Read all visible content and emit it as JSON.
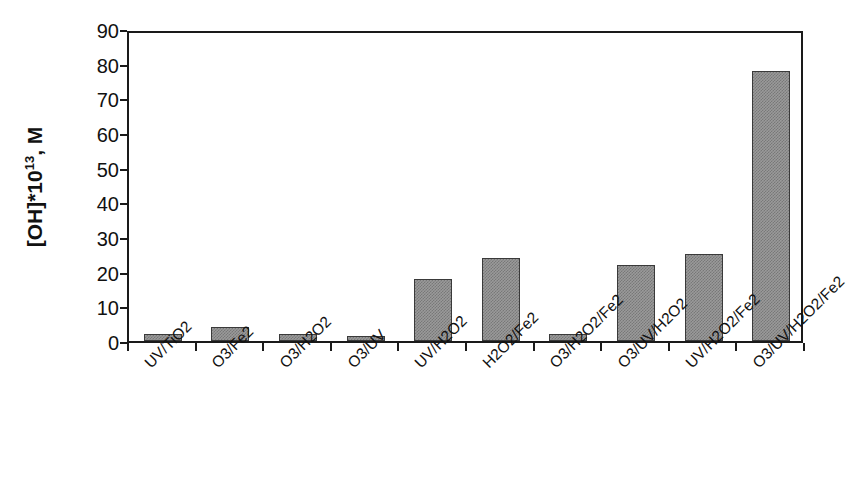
{
  "chart_data": {
    "type": "bar",
    "title": "",
    "subtitle": "",
    "xlabel": "",
    "ylabel": "[OH]*10^13, M",
    "ylabel_parts": {
      "base": "[OH]*10",
      "exponent": "13",
      "suffix": ", M"
    },
    "categories": [
      "UV/TiO2",
      "O3/Fe2",
      "O3/H2O2",
      "O3/UV",
      "UV/H2O2",
      "H2O2/Fe2",
      "O3/H2O2/Fe2",
      "O3/UV/H2O2",
      "UV/H2O2/Fe2",
      "O3/UV/H2O2/Fe2"
    ],
    "values": [
      2,
      4,
      2,
      1.5,
      18,
      24,
      2,
      22,
      25,
      78
    ],
    "ylim": [
      0,
      90
    ],
    "ytick_values": [
      0,
      10,
      20,
      30,
      40,
      50,
      60,
      70,
      80,
      90
    ],
    "ytick_labels": [
      "0",
      "10",
      "20",
      "30",
      "40",
      "50",
      "60",
      "70",
      "80",
      "90"
    ],
    "grid": false,
    "legend": null,
    "legend_position": "none",
    "bar_fill_color": "#9a9a9a",
    "bar_pattern_color": "#787878",
    "bar_edge_color": "#3a3a3a",
    "axis_color": "#1a1a1a",
    "background_color": "#ffffff",
    "xlabel_rotation_deg": -45
  }
}
